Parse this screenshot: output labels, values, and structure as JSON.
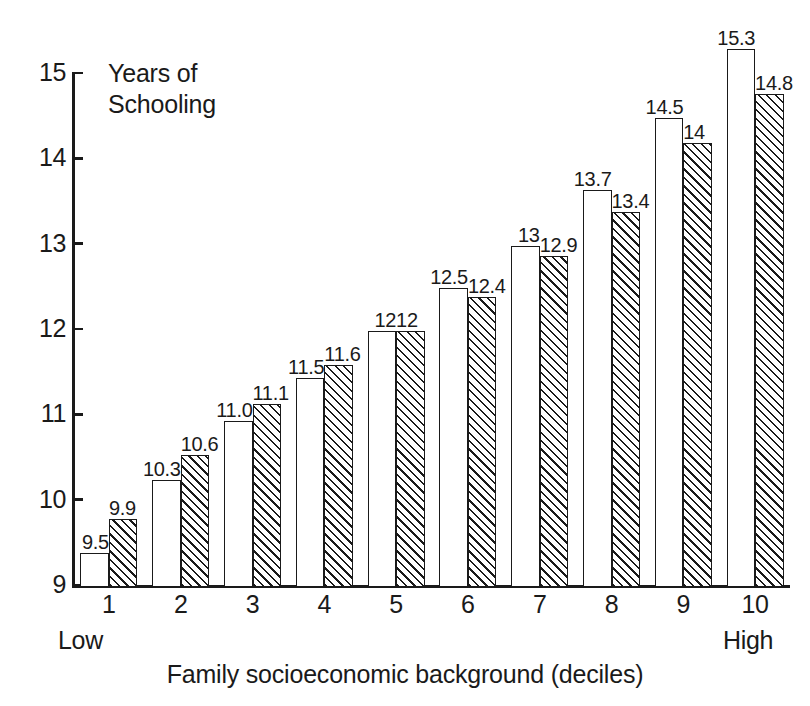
{
  "chart_data": {
    "type": "bar",
    "title": "",
    "subtitle": "",
    "xlabel": "Family socioeconomic background (deciles)",
    "ylabel": "Years of\nSchooling",
    "ylim": [
      9,
      15
    ],
    "ytick_labels": [
      "9",
      "10",
      "11",
      "12",
      "13",
      "14",
      "15"
    ],
    "yticks": [
      9,
      10,
      11,
      12,
      13,
      14,
      15
    ],
    "grid": false,
    "legend": "none",
    "categories": [
      "1",
      "2",
      "3",
      "4",
      "5",
      "6",
      "7",
      "8",
      "9",
      "10"
    ],
    "category_endcaps": {
      "left": "Low",
      "right": "High"
    },
    "series": [
      {
        "name": "series-a",
        "fill": "white",
        "values": [
          9.4,
          10.25,
          10.95,
          11.45,
          12.0,
          12.5,
          13.0,
          13.65,
          14.5,
          15.3
        ],
        "labels": [
          "9.5",
          "10.3",
          "11.0",
          "11.5",
          "12",
          "12.5",
          "13",
          "13.7",
          "14.5",
          "15.3"
        ]
      },
      {
        "name": "series-b",
        "fill": "diagonal-hatch",
        "values": [
          9.8,
          10.55,
          11.15,
          11.6,
          12.0,
          12.4,
          12.88,
          13.4,
          14.2,
          14.78
        ],
        "labels": [
          "9.9",
          "10.6",
          "11.1",
          "11.6",
          "12",
          "12.4",
          "12.9",
          "13.4",
          "14",
          "14.8"
        ]
      }
    ],
    "colors": {
      "ink": "#1a1a1a",
      "background": "#ffffff",
      "series_a_fill": "#ffffff",
      "series_b_fill": "#ffffff"
    }
  }
}
